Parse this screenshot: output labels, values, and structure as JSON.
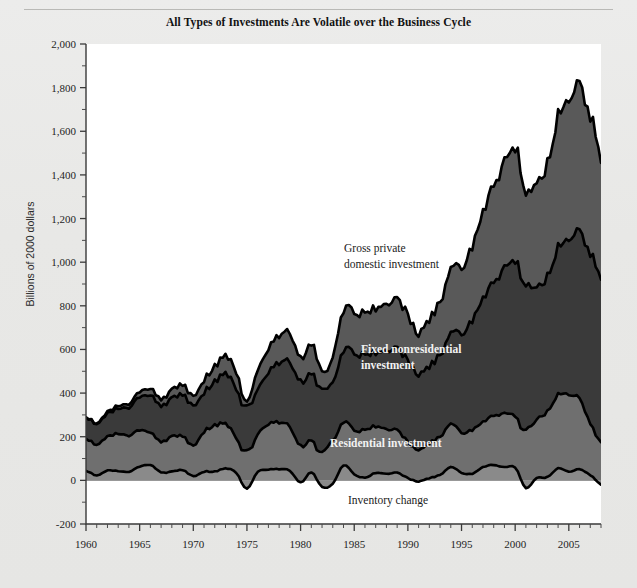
{
  "figure": {
    "title": "All Types of Investments Are Volatile over the Business Cycle",
    "ylabel": "Billions of 2000 dollars"
  },
  "annotations": {
    "gross_line1": "Gross private",
    "gross_line2": "domestic investment",
    "fixed_line1": "Fixed nonresidential",
    "fixed_line2": "investment",
    "residential": "Residential investment",
    "inventory": "Inventory change"
  },
  "colors": {
    "background": "#e8e8e6",
    "plot_background": "#ffffff",
    "band_gross": "#595959",
    "band_fixed": "#3a3a3a",
    "band_residential": "#6f6f6f",
    "band_inventory": "#8a8a8a",
    "line": "#000000",
    "axis": "#3a3a3a",
    "text": "#1a1a1a"
  },
  "chart_data": {
    "type": "area",
    "title": "All Types of Investments Are Volatile over the Business Cycle",
    "xlabel": "",
    "ylabel": "Billions of 2000 dollars",
    "xlim": [
      1960,
      2008
    ],
    "ylim": [
      -200,
      2000
    ],
    "ytick_labels": [
      "2,000",
      "1,800",
      "1,600",
      "1,400",
      "1,200",
      "1,000",
      "800",
      "600",
      "400",
      "200",
      "0",
      "-200"
    ],
    "ytick_values": [
      2000,
      1800,
      1600,
      1400,
      1200,
      1000,
      800,
      600,
      400,
      200,
      0,
      -200
    ],
    "ytick_minor_step": 100,
    "xtick_labels": [
      "1960",
      "1965",
      "1970",
      "1975",
      "1980",
      "1985",
      "1990",
      "1995",
      "2000",
      "2005"
    ],
    "xtick_values": [
      1960,
      1965,
      1970,
      1975,
      1980,
      1985,
      1990,
      1995,
      2000,
      2005
    ],
    "xtick_minor_step": 1,
    "grid": false,
    "legend": "inline-annotations",
    "stacking": "stacked-from-zero",
    "x": [
      1960,
      1961,
      1962,
      1963,
      1964,
      1965,
      1966,
      1967,
      1968,
      1969,
      1970,
      1971,
      1972,
      1973,
      1974,
      1975,
      1976,
      1977,
      1978,
      1979,
      1980,
      1981,
      1982,
      1983,
      1984,
      1985,
      1986,
      1987,
      1988,
      1989,
      1990,
      1991,
      1992,
      1993,
      1994,
      1995,
      1996,
      1997,
      1998,
      1999,
      2000,
      2001,
      2002,
      2003,
      2004,
      2005,
      2006,
      2007,
      2008
    ],
    "series": [
      {
        "name": "Inventory change",
        "color": "#8a8a8a",
        "values": [
          45,
          22,
          45,
          42,
          40,
          62,
          70,
          37,
          40,
          47,
          20,
          40,
          40,
          55,
          35,
          -40,
          40,
          50,
          52,
          45,
          -10,
          38,
          -30,
          -15,
          70,
          28,
          12,
          35,
          30,
          35,
          10,
          -5,
          10,
          25,
          60,
          35,
          30,
          60,
          70,
          60,
          60,
          -35,
          10,
          15,
          55,
          40,
          50,
          25,
          -20
        ]
      },
      {
        "name": "Residential investment",
        "color": "#6f6f6f",
        "values": [
          150,
          140,
          155,
          170,
          168,
          165,
          148,
          140,
          160,
          155,
          140,
          185,
          210,
          205,
          160,
          135,
          175,
          210,
          215,
          205,
          160,
          150,
          130,
          185,
          200,
          200,
          220,
          215,
          205,
          195,
          165,
          140,
          160,
          175,
          195,
          185,
          200,
          205,
          225,
          245,
          240,
          235,
          265,
          300,
          335,
          355,
          320,
          240,
          175
        ]
      },
      {
        "name": "Fixed nonresidential investment",
        "color": "#3a3a3a",
        "values": [
          100,
          95,
          105,
          115,
          130,
          150,
          170,
          165,
          175,
          190,
          185,
          180,
          200,
          230,
          225,
          200,
          210,
          240,
          275,
          300,
          295,
          310,
          290,
          270,
          330,
          350,
          345,
          340,
          360,
          375,
          370,
          345,
          350,
          375,
          410,
          455,
          500,
          560,
          610,
          665,
          720,
          665,
          600,
          620,
          670,
          715,
          760,
          785,
          745
        ]
      }
    ],
    "total_series": {
      "name": "Gross private domestic investment",
      "color": "#595959",
      "values": [
        295,
        257,
        305,
        327,
        338,
        377,
        388,
        342,
        375,
        392,
        345,
        405,
        450,
        490,
        420,
        295,
        425,
        500,
        542,
        550,
        445,
        498,
        390,
        440,
        600,
        578,
        577,
        590,
        595,
        605,
        545,
        480,
        520,
        575,
        665,
        675,
        730,
        825,
        905,
        970,
        1020,
        865,
        875,
        935,
        1060,
        1110,
        1130,
        1050,
        900
      ]
    },
    "notable_points": [
      {
        "year": 1960,
        "total": 295,
        "note": "series start"
      },
      {
        "year": 1975,
        "total": 295,
        "note": "recession trough"
      },
      {
        "year": 1982,
        "total": 390,
        "note": "recession trough"
      },
      {
        "year": 1991,
        "total": 480,
        "note": "recession trough"
      },
      {
        "year": 2000,
        "total": 1790,
        "note": "dot-com peak (indexed scale peak)"
      },
      {
        "year": 2006,
        "total": 1940,
        "note": "housing-era peak"
      },
      {
        "year": 2008,
        "total": 1860,
        "note": "series end"
      }
    ]
  }
}
